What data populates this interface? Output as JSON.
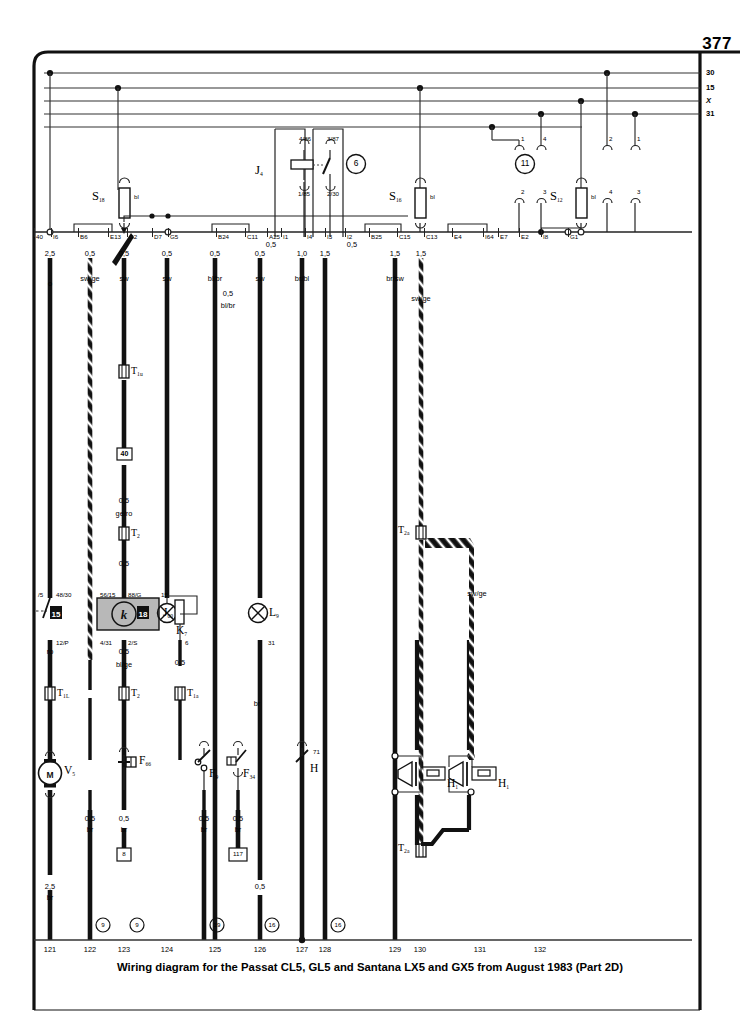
{
  "page": {
    "number": "377",
    "caption": "Wiring diagram for the Passat CL5, GL5 and Santana LX5 and GX5 from August 1983 (Part 2D)"
  },
  "bus_labels": [
    {
      "name": "terminal-30",
      "text": "30",
      "y": 73
    },
    {
      "name": "terminal-15",
      "text": "15",
      "y": 88
    },
    {
      "name": "terminal-x",
      "text": "X",
      "y": 101
    },
    {
      "name": "terminal-31",
      "text": "31",
      "y": 114
    }
  ],
  "relay_positions": [
    {
      "name": "relay-position-6",
      "text": "6",
      "x": 356,
      "y": 164
    },
    {
      "name": "relay-position-11",
      "text": "11",
      "x": 525,
      "y": 164
    }
  ],
  "relay_j4": {
    "label": "J",
    "sub": "4",
    "terminals": [
      "4/86",
      "3/87",
      "1/85",
      "2/30"
    ]
  },
  "fuses": [
    {
      "name": "fuse-s18",
      "label": "S",
      "sub": "18",
      "color": "bl",
      "x": 124,
      "y": 203
    },
    {
      "name": "fuse-s16",
      "label": "S",
      "sub": "16",
      "color": "bl",
      "x": 420,
      "y": 203
    },
    {
      "name": "fuse-s12",
      "label": "S",
      "sub": "12",
      "color": "bl",
      "x": 587,
      "y": 203
    }
  ],
  "plug_pins_upper": [
    {
      "text": "1",
      "x": 519,
      "y": 140
    },
    {
      "text": "4",
      "x": 541,
      "y": 140
    },
    {
      "text": "2",
      "x": 607,
      "y": 140
    },
    {
      "text": "1",
      "x": 635,
      "y": 140
    }
  ],
  "plug_pins_lower": [
    {
      "text": "2",
      "x": 519,
      "y": 193
    },
    {
      "text": "3",
      "x": 541,
      "y": 193
    },
    {
      "text": "4",
      "x": 607,
      "y": 193
    },
    {
      "text": "3",
      "x": 635,
      "y": 193
    }
  ],
  "terminal_strip": [
    {
      "text": "40",
      "x": 34
    },
    {
      "text": "I6",
      "x": 51
    },
    {
      "text": "B6",
      "x": 78
    },
    {
      "text": "E13",
      "x": 108
    },
    {
      "text": "G2",
      "x": 127
    },
    {
      "text": "D7",
      "x": 152
    },
    {
      "text": "G5",
      "x": 168
    },
    {
      "text": "B24",
      "x": 216
    },
    {
      "text": "C11",
      "x": 245
    },
    {
      "text": "A25",
      "x": 267
    },
    {
      "text": "I1",
      "x": 281
    },
    {
      "text": "I4",
      "x": 305
    },
    {
      "text": "I3",
      "x": 325
    },
    {
      "text": "I2",
      "x": 345
    },
    {
      "text": "B25",
      "x": 369
    },
    {
      "text": "C15",
      "x": 397
    },
    {
      "text": "C13",
      "x": 424
    },
    {
      "text": "E4",
      "x": 452
    },
    {
      "text": "I64",
      "x": 483
    },
    {
      "text": "E7",
      "x": 498
    },
    {
      "text": "E2",
      "x": 519
    },
    {
      "text": "I8",
      "x": 541
    },
    {
      "text": "G1",
      "x": 568
    }
  ],
  "wire_specs": [
    {
      "size": "2,5",
      "color": "o",
      "x": 50,
      "y_size": 250,
      "y_color": 280
    },
    {
      "size": "0,5",
      "color": "sw/ge",
      "x": 90,
      "y_size": 250,
      "y_color": 275
    },
    {
      "size": "0,5",
      "color": "sw",
      "x": 124,
      "y_size": 250,
      "y_color": 275
    },
    {
      "size": "0,5",
      "color": "sw",
      "x": 167,
      "y_size": 250,
      "y_color": 275
    },
    {
      "size": "0,5",
      "color": "bl/br",
      "x": 215,
      "y_size": 250,
      "y_color": 275
    },
    {
      "size": "0,5",
      "color": "sw",
      "x": 260,
      "y_size": 250,
      "y_color": 275
    },
    {
      "size": "0,5",
      "color": "bl/br",
      "x": 228,
      "y_size": 290,
      "y_color": 302
    },
    {
      "size": "1,0",
      "color": "br/bl",
      "x": 302,
      "y_size": 250,
      "y_color": 275
    },
    {
      "size": "1,5",
      "color": "",
      "x": 325,
      "y_size": 250,
      "y_color": 275
    },
    {
      "size": "1,5",
      "color": "br/sw",
      "x": 395,
      "y_size": 250,
      "y_color": 275
    },
    {
      "size": "1,5",
      "color": "sw/ge",
      "x": 421,
      "y_size": 250,
      "y_color": 295
    },
    {
      "size": "0,5",
      "color": "",
      "x": 271,
      "y_size": 241,
      "y_color": 0
    },
    {
      "size": "0,5",
      "color": "",
      "x": 352,
      "y_size": 241,
      "y_color": 0
    },
    {
      "size": "0,5",
      "color": "ge/ro",
      "x": 124,
      "y_size": 497,
      "y_color": 510
    },
    {
      "size": "0,5",
      "color": "",
      "x": 124,
      "y_size": 560,
      "y_color": 0
    },
    {
      "size": "",
      "color": "ro",
      "x": 50,
      "y_size": 0,
      "y_color": 648
    },
    {
      "size": "0,5",
      "color": "bl/ge",
      "x": 124,
      "y_size": 648,
      "y_color": 661
    },
    {
      "size": "0,5",
      "color": "",
      "x": 180,
      "y_size": 659,
      "y_color": 0
    },
    {
      "size": "",
      "color": "br",
      "x": 257,
      "y_size": 0,
      "y_color": 700
    },
    {
      "size": "",
      "color": "sw/ge",
      "x": 477,
      "y_size": 0,
      "y_color": 590
    }
  ],
  "wire_specs_bottom": [
    {
      "size": "0,5",
      "color": "br",
      "x": 90,
      "y": 815
    },
    {
      "size": "0,5",
      "color": "br",
      "x": 124,
      "y": 815
    },
    {
      "size": "0,5",
      "color": "br",
      "x": 204,
      "y": 815
    },
    {
      "size": "0,5",
      "color": "br",
      "x": 238,
      "y": 815
    },
    {
      "size": "0,5",
      "color": "",
      "x": 260,
      "y": 883
    },
    {
      "size": "2,5",
      "color": "br",
      "x": 50,
      "y": 883
    }
  ],
  "components": [
    {
      "name": "connector-t1u",
      "label": "T",
      "sub": "1u",
      "x": 124,
      "y": 372
    },
    {
      "name": "box-40",
      "label": "40",
      "x": 124,
      "y": 457
    },
    {
      "name": "connector-t2",
      "label": "T",
      "sub": "2",
      "x": 124,
      "y": 534
    },
    {
      "name": "connector-t1l",
      "label": "T",
      "sub": "1L",
      "x": 50,
      "y": 694
    },
    {
      "name": "connector-t2b",
      "label": "T",
      "sub": "2",
      "x": 124,
      "y": 694
    },
    {
      "name": "connector-t1a",
      "label": "T",
      "sub": "1a",
      "x": 180,
      "y": 694
    },
    {
      "name": "connector-t2a-top",
      "label": "T",
      "sub": "2a",
      "x": 421,
      "y": 533
    },
    {
      "name": "connector-t2a-bottom",
      "label": "T",
      "sub": "2a",
      "x": 421,
      "y": 851
    },
    {
      "name": "switch-15",
      "label": "15",
      "x": 56,
      "y": 613
    },
    {
      "name": "relay-j00",
      "label": "J",
      "sub": "00",
      "x": 88,
      "y": 613
    },
    {
      "name": "switch-18",
      "label": "18",
      "x": 143,
      "y": 613
    },
    {
      "name": "lamp-k7",
      "label": "K",
      "sub": "7",
      "x": 159,
      "y": 628
    },
    {
      "name": "lamp-l9",
      "label": "L",
      "sub": "9",
      "x": 268,
      "y": 613
    },
    {
      "name": "motor-v",
      "label": "V",
      "sub": "5",
      "x": 62,
      "y": 773
    },
    {
      "name": "switch-f66",
      "label": "F",
      "sub": "66",
      "x": 140,
      "y": 770
    },
    {
      "name": "switch-f9",
      "label": "F",
      "sub": "9",
      "x": 215,
      "y": 784
    },
    {
      "name": "switch-f34",
      "label": "F",
      "sub": "34",
      "x": 248,
      "y": 784
    },
    {
      "name": "sensor-h",
      "label": "H",
      "x": 311,
      "y": 770
    },
    {
      "name": "horn-h-left",
      "label": "H",
      "sub": "1",
      "x": 447,
      "y": 780
    },
    {
      "name": "horn-h-right",
      "label": "H",
      "sub": "1",
      "x": 498,
      "y": 780
    }
  ],
  "relay_track_refs": [
    {
      "text": "9",
      "x": 90
    },
    {
      "text": "9",
      "x": 124
    },
    {
      "text": "19",
      "x": 204
    },
    {
      "text": "16",
      "x": 260
    },
    {
      "text": "16",
      "x": 325
    }
  ],
  "ground_refs": [
    {
      "text": "8",
      "x": 124,
      "y": 855
    },
    {
      "text": "117",
      "x": 238,
      "y": 855
    }
  ],
  "component_pins": [
    {
      "text": "/5",
      "x": 38,
      "y": 592
    },
    {
      "text": "48/30",
      "x": 56,
      "y": 592
    },
    {
      "text": "12/P",
      "x": 56,
      "y": 640
    },
    {
      "text": "56/15",
      "x": 100,
      "y": 592
    },
    {
      "text": "4/31",
      "x": 100,
      "y": 640
    },
    {
      "text": "88/G",
      "x": 128,
      "y": 592
    },
    {
      "text": "2/S",
      "x": 128,
      "y": 640
    },
    {
      "text": "15",
      "x": 161,
      "y": 592
    },
    {
      "text": "6",
      "x": 185,
      "y": 640
    },
    {
      "text": "31",
      "x": 268,
      "y": 640
    },
    {
      "text": "71",
      "x": 313,
      "y": 749
    }
  ],
  "bottom_numbers": [
    "121",
    "122",
    "123",
    "124",
    "125",
    "126",
    "127",
    "128",
    "129",
    "130",
    "131",
    "132"
  ],
  "colors": {
    "line": "#1a1a1a",
    "thin": "#555555",
    "relay_fill": "#b8b8b8",
    "background": "#ffffff"
  }
}
